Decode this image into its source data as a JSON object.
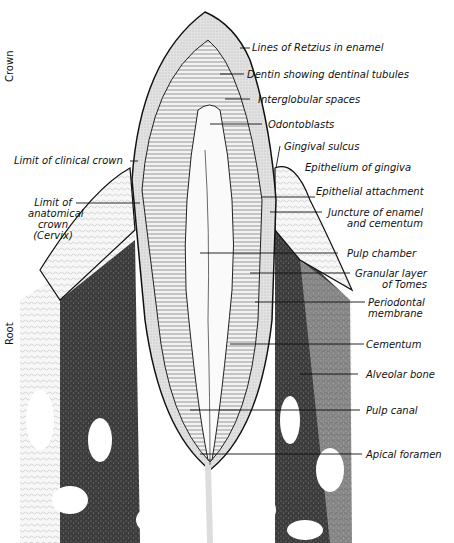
{
  "diagram": {
    "side_labels": {
      "crown": "Crown",
      "root": "Root"
    },
    "labels_left": [
      {
        "id": "limit-clinical-crown",
        "text": "Limit of clinical crown"
      },
      {
        "id": "limit-anatomical-crown",
        "lines": [
          "Limit of",
          "anatomical",
          "crown",
          "(Cervix)"
        ]
      }
    ],
    "labels_right": [
      {
        "id": "lines-of-retzius",
        "text": "Lines of Retzius in enamel"
      },
      {
        "id": "dentin",
        "text": "Dentin showing dentinal tubules"
      },
      {
        "id": "interglobular-spaces",
        "text": "Interglobular spaces"
      },
      {
        "id": "odontoblasts",
        "text": "Odontoblasts"
      },
      {
        "id": "gingival-sulcus",
        "text": "Gingival sulcus"
      },
      {
        "id": "epithelium-of-gingiva",
        "text": "Epithelium of gingiva"
      },
      {
        "id": "epithelial-attachment",
        "text": "Epithelial attachment"
      },
      {
        "id": "juncture-enamel-cementum",
        "lines": [
          "Juncture of enamel",
          "and cementum"
        ]
      },
      {
        "id": "pulp-chamber",
        "text": "Pulp chamber"
      },
      {
        "id": "granular-layer-tomes",
        "lines": [
          "Granular layer",
          "of Tomes"
        ]
      },
      {
        "id": "periodontal-membrane",
        "lines": [
          "Periodontal",
          "membrane"
        ]
      },
      {
        "id": "cementum",
        "text": "Cementum"
      },
      {
        "id": "alveolar-bone",
        "text": "Alveolar bone"
      },
      {
        "id": "pulp-canal",
        "text": "Pulp canal"
      },
      {
        "id": "apical-foramen",
        "text": "Apical foramen"
      }
    ],
    "colors": {
      "ink": "#111111",
      "bone": "#3a3a3a",
      "enamel": "#d8d8d8",
      "dentin": "#ececec",
      "paper": "#ffffff"
    }
  }
}
